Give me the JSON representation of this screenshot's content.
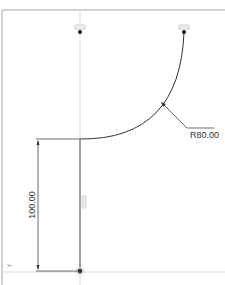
{
  "sketch": {
    "colors": {
      "background": "#ffffff",
      "frame": "#9a9a9a",
      "geometry": "#333333",
      "construction": "#d0d0d0",
      "dimension": "#333333",
      "point": "#111111",
      "constraint_badge": "#b8b8b8"
    },
    "dimensions": {
      "radius_label": "R80.00",
      "vertical_label": "100.00"
    },
    "constraints": {
      "top_left_badge": "coincident-constraint",
      "top_right_badge": "coincident-constraint",
      "vertical_line_badge": "vertical-constraint"
    },
    "axis_label": "Y"
  }
}
